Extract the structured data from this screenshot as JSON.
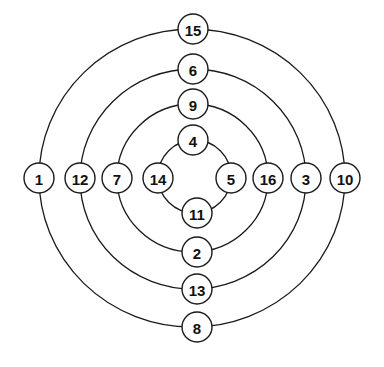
{
  "diagram": {
    "type": "concentric-rings",
    "center": {
      "x": 195,
      "y": 178
    },
    "node_radius": 15,
    "colors": {
      "stroke": "#1a1a1a",
      "fill": "#ffffff",
      "text": "#111111"
    },
    "rings": [
      {
        "id": "ring-1",
        "rx": 153,
        "ry": 150,
        "nodes": [
          {
            "label": "15",
            "position": "top",
            "x": 193,
            "y": 29
          },
          {
            "label": "10",
            "position": "right",
            "x": 345,
            "y": 178
          },
          {
            "label": "8",
            "position": "bottom",
            "x": 197,
            "y": 327
          },
          {
            "label": "1",
            "position": "left",
            "x": 39,
            "y": 178
          }
        ]
      },
      {
        "id": "ring-2",
        "rx": 113,
        "ry": 110,
        "nodes": [
          {
            "label": "6",
            "position": "top",
            "x": 193,
            "y": 69
          },
          {
            "label": "3",
            "position": "right",
            "x": 306,
            "y": 178
          },
          {
            "label": "13",
            "position": "bottom",
            "x": 197,
            "y": 289
          },
          {
            "label": "12",
            "position": "left",
            "x": 80,
            "y": 178
          }
        ]
      },
      {
        "id": "ring-3",
        "rx": 75,
        "ry": 74,
        "nodes": [
          {
            "label": "9",
            "position": "top",
            "x": 193,
            "y": 104
          },
          {
            "label": "16",
            "position": "right",
            "x": 268,
            "y": 178
          },
          {
            "label": "2",
            "position": "bottom",
            "x": 197,
            "y": 252
          },
          {
            "label": "7",
            "position": "left",
            "x": 117,
            "y": 178
          }
        ]
      },
      {
        "id": "ring-4",
        "rx": 37,
        "ry": 37,
        "nodes": [
          {
            "label": "4",
            "position": "top",
            "x": 193,
            "y": 140
          },
          {
            "label": "5",
            "position": "right",
            "x": 231,
            "y": 178
          },
          {
            "label": "11",
            "position": "bottom",
            "x": 197,
            "y": 213
          },
          {
            "label": "14",
            "position": "left",
            "x": 158,
            "y": 178
          }
        ]
      }
    ]
  }
}
